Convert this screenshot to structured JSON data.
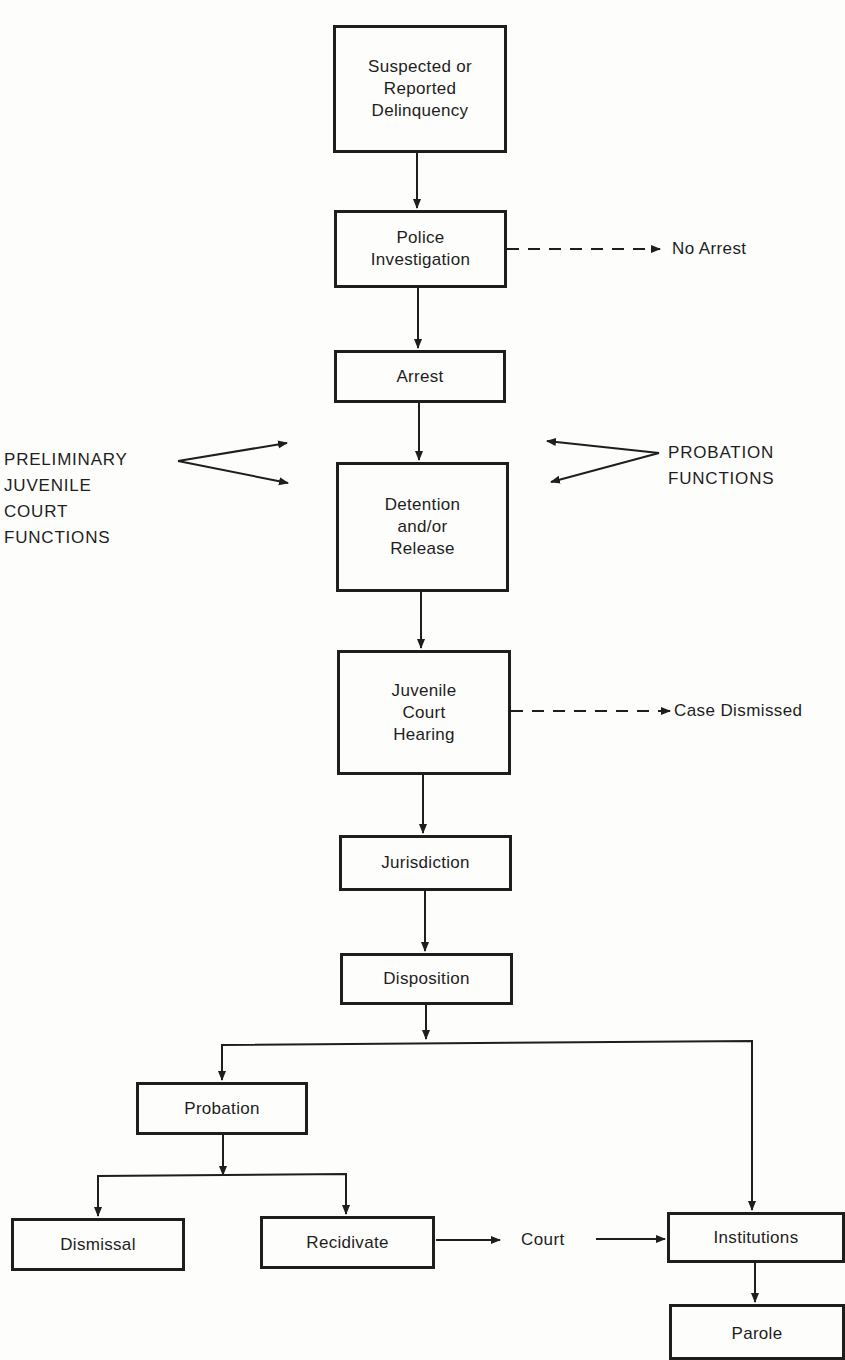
{
  "nodes": {
    "suspected": "Suspected or\nReported\nDelinquency",
    "police": "Police\nInvestigation",
    "arrest": "Arrest",
    "detention": "Detention\nand/or\nRelease",
    "hearing": "Juvenile\nCourt\nHearing",
    "jurisdiction": "Jurisdiction",
    "disposition": "Disposition",
    "probation": "Probation",
    "dismissal": "Dismissal",
    "recidivate": "Recidivate",
    "institutions": "Institutions",
    "parole": "Parole"
  },
  "labels": {
    "no_arrest": "No Arrest",
    "case_dismissed": "Case Dismissed",
    "court": "Court",
    "preliminary": "PRELIMINARY\nJUVENILE\nCOURT\nFUNCTIONS",
    "probation_functions": "PROBATION\nFUNCTIONS"
  },
  "colors": {
    "line": "#1e1e1e",
    "background": "#fdfdfb"
  }
}
